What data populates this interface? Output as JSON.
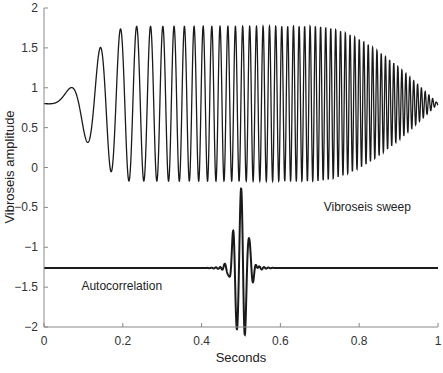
{
  "chart_data": {
    "type": "line",
    "title": "",
    "xlabel": "Seconds",
    "ylabel": "Vibroseis amplitude",
    "xlim": [
      0,
      1
    ],
    "ylim": [
      -2,
      2
    ],
    "xticks": [
      0,
      0.2,
      0.4,
      0.6,
      0.8,
      1
    ],
    "xtick_labels": [
      "0",
      "0.2",
      "0.4",
      "0.6",
      "0.8",
      "1"
    ],
    "yticks": [
      -2,
      -1.5,
      -1,
      -0.5,
      0,
      0.5,
      1,
      1.5,
      2
    ],
    "ytick_labels": [
      "−2",
      "−1.5",
      "−1",
      "−0.5",
      "0",
      "0.5",
      "1",
      "1.5",
      "2"
    ],
    "grid": false,
    "legend": null,
    "series": [
      {
        "name": "Vibroseis sweep",
        "description": "Linear up-sweep chirp offset to baseline 0.8, peak amplitude ~0.97 (range ~-0.17 to 1.77), tapered in near t=0 and tapered out from t~0.7 to 1.0",
        "baseline": 0.8,
        "amplitude": 0.97,
        "t_start": 0.0,
        "t_end": 1.0,
        "taper_in_end": 0.22,
        "taper_out_start": 0.68,
        "approx_cycles": 55,
        "color": "#1a1a1a"
      },
      {
        "name": "Autocorrelation",
        "description": "Klauder-like wavelet centered at t=0.5 on baseline -1.26; peak ~-0.27, troughs ~-1.78",
        "baseline": -1.26,
        "center": 0.5,
        "peak": -0.27,
        "trough": -1.78,
        "color": "#1a1a1a"
      }
    ],
    "annotations": [
      {
        "text": "Vibroseis sweep",
        "x": 0.71,
        "y": -0.55
      },
      {
        "text": "Autocorrelation",
        "x": 0.095,
        "y": -1.53
      }
    ]
  }
}
